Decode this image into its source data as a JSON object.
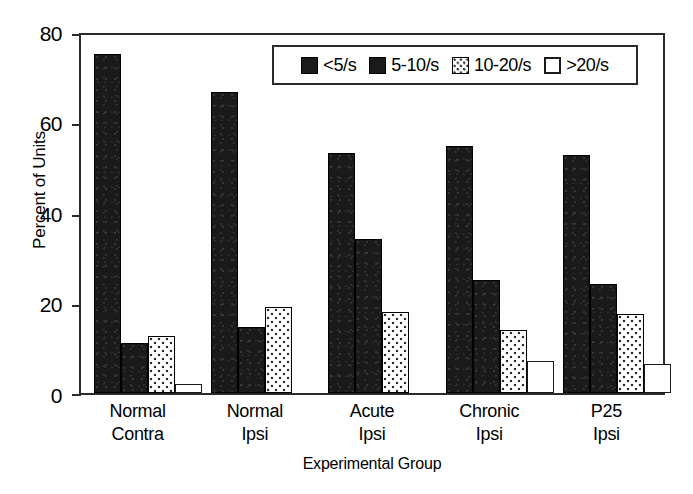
{
  "chart_data": {
    "type": "bar",
    "title": "",
    "xlabel": "Experimental Group",
    "ylabel": "Percent of Units",
    "ylim": [
      0,
      80
    ],
    "yticks": [
      0,
      20,
      40,
      60,
      80
    ],
    "grid": false,
    "legend_position": "top-right-inside",
    "categories": [
      "Normal Contra",
      "Normal Ipsi",
      "Acute Ipsi",
      "Chronic Ipsi",
      "P25 Ipsi"
    ],
    "category_lines": [
      {
        "line1": "Normal",
        "line2": "Contra"
      },
      {
        "line1": "Normal",
        "line2": "Ipsi"
      },
      {
        "line1": "Acute",
        "line2": "Ipsi"
      },
      {
        "line1": "Chronic",
        "line2": "Ipsi"
      },
      {
        "line1": "P25",
        "line2": "Ipsi"
      }
    ],
    "series": [
      {
        "name": "<5/s",
        "fill": "solid-black",
        "values": [
          75.0,
          66.5,
          53.0,
          54.5,
          52.5
        ]
      },
      {
        "name": "5-10/s",
        "fill": "solid-black",
        "values": [
          11.0,
          14.5,
          34.0,
          25.0,
          24.0
        ]
      },
      {
        "name": "10-20/s",
        "fill": "dotted",
        "values": [
          12.5,
          19.0,
          18.0,
          14.0,
          17.5
        ]
      },
      {
        "name": ">20/s",
        "fill": "white",
        "values": [
          2.0,
          0.0,
          0.0,
          7.0,
          6.5
        ]
      }
    ]
  },
  "legend": {
    "entries": [
      {
        "label": "<5/s"
      },
      {
        "label": "5-10/s"
      },
      {
        "label": "10-20/s"
      },
      {
        "label": ">20/s"
      }
    ]
  },
  "axes": {
    "y_tick_labels": [
      "80",
      "60",
      "40",
      "20",
      "0"
    ],
    "y_axis_title": "Percent of Units",
    "x_axis_title": "Experimental Group"
  },
  "colors": {
    "bar_dark": "#1a1a1a",
    "bar_white": "#ffffff",
    "axis": "#2b2b2b",
    "text": "#000000"
  }
}
